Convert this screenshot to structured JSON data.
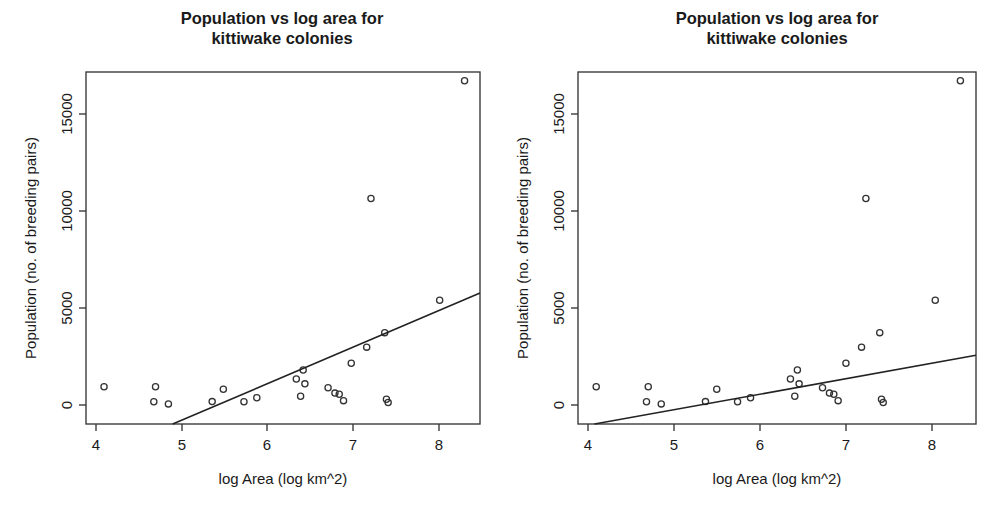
{
  "figure": {
    "background_color": "#ffffff",
    "point_color": "#333333",
    "line_color": "#222222",
    "axis_color": "#3c3c3c",
    "panel_count": 2
  },
  "chart_data": [
    {
      "type": "scatter",
      "panel_index": 0,
      "panel_name": "left-panel",
      "title": "Population vs log area for\nkittiwake colonies",
      "title_line1": "Population vs log area for",
      "title_line2": "kittiwake colonies",
      "xlabel": "log Area (log km^2)",
      "ylabel": "Population (no. of breeding pairs)",
      "xlim": [
        3.88,
        8.47
      ],
      "ylim": [
        -980,
        17250
      ],
      "xticks": [
        4,
        5,
        6,
        7,
        8
      ],
      "xtick_labels": [
        "4",
        "5",
        "6",
        "7",
        "8"
      ],
      "yticks": [
        0,
        5000,
        10000,
        15000
      ],
      "ytick_labels": [
        "0",
        "5000",
        "10000",
        "15000"
      ],
      "grid": false,
      "legend": false,
      "marker": "open-circle",
      "x": [
        4.09,
        4.67,
        4.69,
        4.84,
        5.35,
        5.48,
        5.72,
        5.87,
        6.33,
        6.38,
        6.41,
        6.43,
        6.7,
        6.78,
        6.83,
        6.88,
        6.97,
        7.15,
        7.2,
        7.36,
        7.38,
        7.4,
        8.0,
        8.29
      ],
      "y": [
        950,
        170,
        950,
        60,
        180,
        820,
        170,
        380,
        1350,
        460,
        1820,
        1100,
        900,
        620,
        560,
        230,
        2170,
        3000,
        10700,
        3750,
        300,
        130,
        5430,
        16800
      ],
      "series_label": "kittiwake colonies",
      "fit": {
        "label": "regression line (all data)",
        "x_start": 4.89,
        "y_start": -980,
        "x_end": 8.47,
        "y_end": 5800
      }
    },
    {
      "type": "scatter",
      "panel_index": 1,
      "panel_name": "right-panel",
      "title": "Population vs log area for\nkittiwake colonies",
      "title_line1": "Population vs log area for",
      "title_line2": "kittiwake colonies",
      "xlabel": "log Area (log km^2)",
      "ylabel": "Population (no. of breeding pairs)",
      "xlim": [
        3.88,
        8.47
      ],
      "ylim": [
        -980,
        17250
      ],
      "xticks": [
        4,
        5,
        6,
        7,
        8
      ],
      "xtick_labels": [
        "4",
        "5",
        "6",
        "7",
        "8"
      ],
      "yticks": [
        0,
        5000,
        10000,
        15000
      ],
      "ytick_labels": [
        "0",
        "5000",
        "10000",
        "15000"
      ],
      "grid": false,
      "legend": false,
      "marker": "open-circle",
      "x": [
        4.09,
        4.67,
        4.69,
        4.84,
        5.35,
        5.48,
        5.72,
        5.87,
        6.33,
        6.38,
        6.41,
        6.43,
        6.7,
        6.78,
        6.83,
        6.88,
        6.97,
        7.15,
        7.2,
        7.36,
        7.38,
        7.4,
        8.0,
        8.29
      ],
      "y": [
        950,
        170,
        950,
        60,
        180,
        820,
        170,
        380,
        1350,
        460,
        1820,
        1100,
        900,
        620,
        560,
        230,
        2170,
        3000,
        10700,
        3750,
        300,
        130,
        5430,
        16800
      ],
      "series_label": "kittiwake colonies",
      "fit": {
        "label": "regression line (shallower slope)",
        "x_start": 4.07,
        "y_start": -980,
        "x_end": 8.47,
        "y_end": 2580
      }
    }
  ]
}
